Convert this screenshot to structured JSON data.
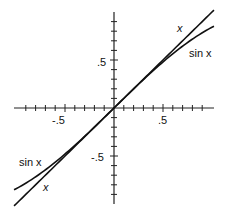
{
  "chart_data": {
    "type": "line",
    "title": "",
    "xlabel": "",
    "ylabel": "",
    "xlim": [
      -1.02,
      1.02
    ],
    "ylim": [
      -0.98,
      0.98
    ],
    "grid": false,
    "legend": "none (inline curve labels)",
    "x_tick_labels": [
      {
        "value": -0.5,
        "label": "-.5"
      },
      {
        "value": 0.5,
        "label": ".5"
      }
    ],
    "y_tick_labels": [
      {
        "value": 0.5,
        "label": ".5"
      },
      {
        "value": -0.5,
        "label": "-.5"
      }
    ],
    "minor_tick_step": 0.1,
    "series": [
      {
        "name": "x",
        "function": "y = x",
        "x": [
          -1.0,
          -0.5,
          0,
          0.5,
          1.0
        ],
        "values": [
          -1.0,
          -0.5,
          0,
          0.5,
          1.0
        ]
      },
      {
        "name": "sin x",
        "function": "y = sin(x)",
        "x": [
          -1.0,
          -0.5,
          0,
          0.5,
          1.0
        ],
        "values": [
          -0.841,
          -0.479,
          0,
          0.479,
          0.841
        ]
      }
    ],
    "annotations": [
      {
        "text": "x",
        "near": "upper-right end of y = x line"
      },
      {
        "text": "sin x",
        "near": "upper-right end of sin curve"
      },
      {
        "text": "sin x",
        "near": "lower-left end of sin curve"
      },
      {
        "text": "x",
        "near": "lower-left end of y = x line"
      }
    ]
  },
  "labels": {
    "x_neg": "-.5",
    "x_pos": ".5",
    "y_pos": ".5",
    "y_neg": "-.5",
    "x_upper": "x",
    "sin_upper": "sin x",
    "sin_lower": "sin x",
    "x_lower": "x"
  }
}
